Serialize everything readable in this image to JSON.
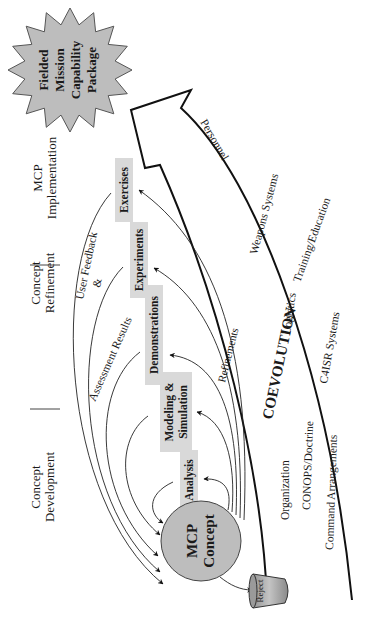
{
  "figure": {
    "orientation": "rotated -90deg (reads bottom-to-top)",
    "colors": {
      "box_fill": "#d9d9d9",
      "circle_fill": "#bdbdbd",
      "starburst_fill": "#bdbdbd",
      "line": "#111111",
      "bucket_fill": "#a8a8a8"
    }
  },
  "phases": [
    {
      "line1": "Concept",
      "line2": "Development"
    },
    {
      "line1": "Concept",
      "line2": "Refinement"
    },
    {
      "line1": "MCP",
      "line2": "Implementation"
    }
  ],
  "activities": [
    {
      "label": "Analysis"
    },
    {
      "label_line1": "Modeling &",
      "label_line2": "Simulation"
    },
    {
      "label": "Demonstrations"
    },
    {
      "label": "Experiments"
    },
    {
      "label": "Exercises"
    }
  ],
  "origin": {
    "line1": "MCP",
    "line2": "Concept"
  },
  "reject": {
    "label": "Reject"
  },
  "outcome": {
    "line1": "Fielded",
    "line2": "Mission",
    "line3": "Capability",
    "line4": "Package"
  },
  "feedback": {
    "line1": "User Feedback",
    "line2": "&",
    "line3": "Assessment Results",
    "refinements": "Refinements"
  },
  "coevolution": {
    "title": "COEVOLUTION",
    "items": [
      "Organization",
      "CONOPS/Doctrine",
      "Command Arrangements",
      "Logistics",
      "C4ISR Systems",
      "Weapons Systems",
      "Training/Education",
      "Personnel"
    ]
  }
}
